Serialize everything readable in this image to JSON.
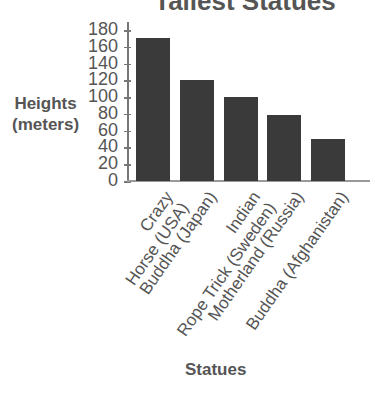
{
  "chart_data": {
    "type": "bar",
    "title": "Tallest Statues",
    "xlabel": "Statues",
    "ylabel": "Heights (meters)",
    "ylabel_lines": [
      "Heights",
      "(meters)"
    ],
    "categories": [
      "Crazy Horse (USA)",
      "Buddha (Japan)",
      "Indian Rope Trick (Sweden)",
      "Motherland (Russia)",
      "Buddha (Afghanistan)"
    ],
    "category_lines": [
      [
        "Crazy",
        "Horse (USA)"
      ],
      [
        "Buddha (Japan)"
      ],
      [
        "Indian",
        "Rope Trick (Sweden)"
      ],
      [
        "Motherland (Russia)"
      ],
      [
        "Buddha (Afghanistan)"
      ]
    ],
    "values": [
      170,
      120,
      100,
      79,
      50
    ],
    "ylim": [
      0,
      180
    ],
    "yticks": [
      0,
      20,
      40,
      60,
      80,
      100,
      120,
      140,
      160,
      180
    ],
    "grid": false,
    "legend": null,
    "bar_color": "#3a3a3a"
  }
}
